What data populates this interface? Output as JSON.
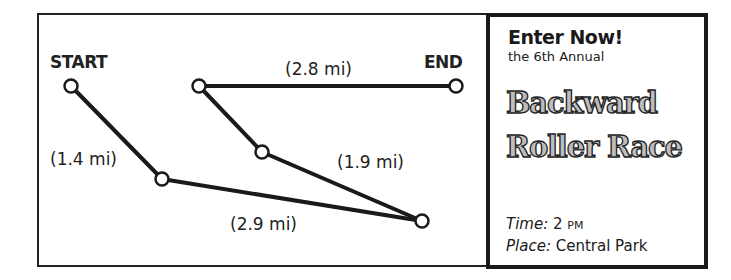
{
  "map": {
    "start_label": "START",
    "end_label": "END",
    "nodes": [
      {
        "id": "start",
        "x": 71,
        "y": 86
      },
      {
        "id": "n2",
        "x": 162,
        "y": 179
      },
      {
        "id": "n5",
        "x": 422,
        "y": 221
      },
      {
        "id": "n4",
        "x": 262,
        "y": 152
      },
      {
        "id": "n3",
        "x": 199,
        "y": 86
      },
      {
        "id": "end",
        "x": 456,
        "y": 86
      }
    ],
    "segments": [
      {
        "from": "start",
        "to": "n2",
        "distance": "(1.4 mi)"
      },
      {
        "from": "n2",
        "to": "n5",
        "distance": "(2.9 mi)"
      },
      {
        "from": "n5",
        "to": "n4",
        "distance": "(1.9 mi)"
      },
      {
        "from": "n4",
        "to": "n3",
        "distance": ""
      },
      {
        "from": "n3",
        "to": "end",
        "distance": "(2.8 mi)"
      }
    ]
  },
  "panel": {
    "heading": "Enter Now!",
    "subheading": "the 6th Annual",
    "title_line1": "Backward",
    "title_line2": "Roller Race",
    "time_key": "Time:",
    "time_value": "2",
    "time_suffix": "PM",
    "place_key": "Place:",
    "place_value": "Central Park"
  }
}
